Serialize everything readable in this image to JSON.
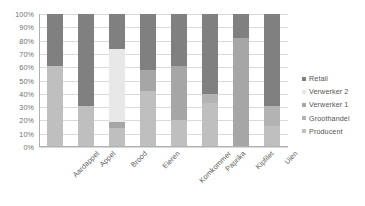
{
  "chart_data": {
    "type": "bar",
    "subtype": "stacked-percent-column",
    "title": "",
    "subtitle": "",
    "xlabel": "",
    "ylabel": "",
    "ylim": [
      0,
      100
    ],
    "ytick_labels": [
      "0%",
      "10%",
      "20%",
      "30%",
      "40%",
      "50%",
      "60%",
      "70%",
      "80%",
      "90%",
      "100%"
    ],
    "ytick_values": [
      0,
      10,
      20,
      30,
      40,
      50,
      60,
      70,
      80,
      90,
      100
    ],
    "grid": true,
    "grid_axis": "y",
    "legend_position": "right",
    "categories": [
      "Aardappel",
      "Appel",
      "Brood",
      "Eieren",
      "Komkommer",
      "Paprika",
      "Kipfilet",
      "Uien"
    ],
    "series": [
      {
        "name": "Producent",
        "color": "#bfbfbf",
        "values": [
          61,
          31,
          14,
          42,
          20,
          33,
          0,
          16
        ]
      },
      {
        "name": "Groothandel",
        "color": "#b3b3b3",
        "values": [
          0,
          0,
          0,
          0,
          0,
          7,
          0,
          15
        ]
      },
      {
        "name": "Verwerker 1",
        "color": "#a6a6a6",
        "values": [
          0,
          0,
          5,
          16,
          41,
          0,
          82,
          0
        ]
      },
      {
        "name": "Verwerker 2",
        "color": "#e8e8e8",
        "values": [
          0,
          0,
          55,
          0,
          0,
          0,
          0,
          0
        ]
      },
      {
        "name": "Retail",
        "color": "#808080",
        "values": [
          39,
          69,
          26,
          42,
          39,
          60,
          18,
          69
        ]
      }
    ],
    "stack_order_bottom_to_top": [
      "Producent",
      "Groothandel",
      "Verwerker 1",
      "Verwerker 2",
      "Retail"
    ],
    "legend_order_top_to_bottom": [
      "Retail",
      "Verwerker 2",
      "Verwerker 1",
      "Groothandel",
      "Producent"
    ]
  },
  "legend": {
    "items": [
      {
        "label": "Retail",
        "color": "#808080"
      },
      {
        "label": "Verwerker 2",
        "color": "#e8e8e8"
      },
      {
        "label": "Verwerker 1",
        "color": "#a6a6a6"
      },
      {
        "label": "Groothandel",
        "color": "#b3b3b3"
      },
      {
        "label": "Producent",
        "color": "#bfbfbf"
      }
    ]
  },
  "colors": {
    "grid": "#d9d9d9",
    "axis": "#b0b0b0",
    "tick_text": "#6e6e6e",
    "category_text": "#5d5d5d",
    "legend_text": "#555555",
    "background": "#ffffff"
  }
}
